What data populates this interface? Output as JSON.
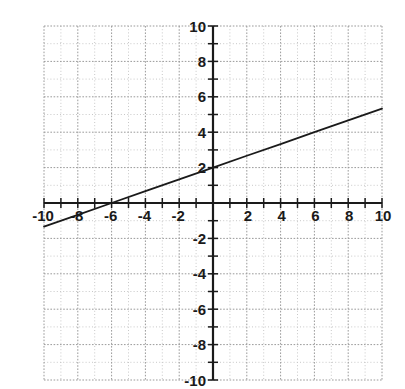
{
  "chart_data": {
    "type": "line",
    "title": "",
    "subtitle": "",
    "xlabel": "",
    "ylabel": "",
    "xlim": [
      -10,
      10
    ],
    "ylim": [
      -10,
      10
    ],
    "grid": true,
    "grid_minor_step": 1,
    "grid_major_step": 2,
    "legend": "none",
    "x_tick_labels": [
      "-10",
      "-8",
      "-6",
      "-4",
      "-2",
      "2",
      "4",
      "6",
      "8",
      "10"
    ],
    "x_tick_values": [
      -10,
      -8,
      -6,
      -4,
      -2,
      2,
      4,
      6,
      8,
      10
    ],
    "y_tick_labels": [
      "10",
      "8",
      "6",
      "4",
      "2",
      "-2",
      "-4",
      "-6",
      "-8",
      "-10"
    ],
    "y_tick_values": [
      10,
      8,
      6,
      4,
      2,
      -2,
      -4,
      -6,
      -8,
      -10
    ],
    "tick_step": 1,
    "series": [
      {
        "name": "line",
        "equation": "y = x/3 + 2",
        "slope": 0.3333,
        "intercept": 2,
        "x_intercept": -6,
        "y_intercept": 2,
        "color": "#1a1a1a",
        "x": [
          -10,
          -8,
          -6,
          -4,
          -2,
          0,
          2,
          4,
          6,
          8,
          10
        ],
        "values": [
          -1.33,
          -0.67,
          0,
          0.67,
          1.33,
          2,
          2.67,
          3.33,
          4,
          4.67,
          5.33
        ]
      }
    ],
    "colors": {
      "background": "#ffffff",
      "axis": "#1a1a1a",
      "grid_minor": "#c8c8c8",
      "grid_major": "#9a9a9a",
      "line": "#1a1a1a",
      "label": "#1a1a1a"
    }
  },
  "axes": {
    "x_axis_name": "x-axis",
    "y_axis_name": "y-axis",
    "origin_label": ""
  }
}
